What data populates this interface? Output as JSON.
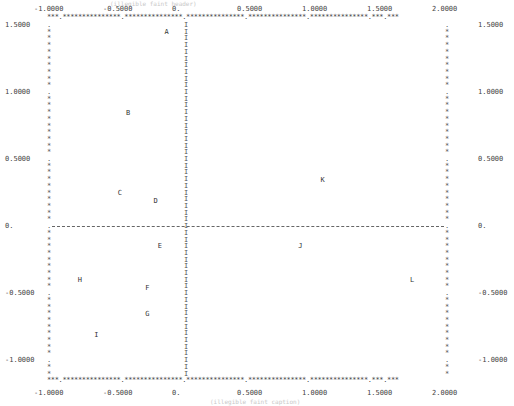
{
  "chart_data": {
    "type": "scatter",
    "footer": "(illegible faint caption)",
    "xlabel": "",
    "ylabel": "",
    "xlim": [
      -1.0,
      2.0
    ],
    "ylim": [
      -1.15,
      1.55
    ],
    "grid": false,
    "reference_lines": {
      "x": 0,
      "y": 0
    },
    "x_ticks": [
      "-1.0000",
      "-0.5000",
      "0.",
      "0.5000",
      "1.0000",
      "1.5000",
      "2.0000"
    ],
    "x_tick_values": [
      -1.0,
      -0.5,
      0.0,
      0.5,
      1.0,
      1.5,
      2.0
    ],
    "y_ticks": [
      "1.5000",
      "1.0000",
      "0.5000",
      "0.",
      "-0.5000",
      "-1.0000"
    ],
    "y_tick_values": [
      1.5,
      1.0,
      0.5,
      0.0,
      -0.5,
      -1.0
    ],
    "points": [
      {
        "label": "A",
        "x": -0.14,
        "y": 1.45
      },
      {
        "label": "B",
        "x": -0.42,
        "y": 0.84
      },
      {
        "label": "C",
        "x": -0.48,
        "y": 0.25
      },
      {
        "label": "D",
        "x": -0.22,
        "y": 0.19
      },
      {
        "label": "E",
        "x": -0.19,
        "y": -0.15
      },
      {
        "label": "F",
        "x": -0.28,
        "y": -0.46
      },
      {
        "label": "G",
        "x": -0.28,
        "y": -0.66
      },
      {
        "label": "H",
        "x": -0.77,
        "y": -0.4
      },
      {
        "label": "I",
        "x": -0.65,
        "y": -0.81
      },
      {
        "label": "J",
        "x": 0.88,
        "y": -0.15
      },
      {
        "label": "K",
        "x": 1.05,
        "y": 0.34
      },
      {
        "label": "L",
        "x": 1.74,
        "y": -0.4
      }
    ]
  },
  "labels": {
    "title": "(illegible faint header)",
    "footer": "(illegible faint caption)",
    "border_char": "*",
    "axis_char": "I",
    "tick_char": "."
  }
}
